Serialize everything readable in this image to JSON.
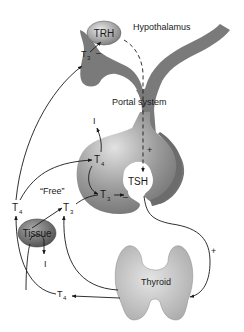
{
  "diagram": {
    "type": "hypothalamic-pituitary-thyroid-axis",
    "labels": {
      "hypothalamus": "Hypothalamus",
      "trh": "TRH",
      "portal_system": "Portal system",
      "tsh": "TSH",
      "thyroid": "Thyroid",
      "tissue": "Tissue",
      "free": "“Free”",
      "t3_hypothalamus": "T",
      "t3_pituitary": "T",
      "t4_pituitary": "T",
      "t4_left": "T",
      "t3_free": "T",
      "t4_bottom": "T",
      "iodide_pituitary": "I",
      "iodide_tissue": "I"
    },
    "subscripts": {
      "t3_hypothalamus": "3",
      "t3_pituitary": "3",
      "t4_pituitary": "4",
      "t4_left": "4",
      "t3_free": "3",
      "t4_bottom": "4"
    },
    "signs": {
      "plus_portal": "+",
      "plus_thyroid": "+",
      "minus_pituitary": "–",
      "minus_hypothalamus": "–"
    },
    "colors": {
      "structure_gray": "#7a7a7a",
      "thyroid_gray": "#c4c4c4",
      "tissue_gray": "#6e6e6e",
      "arrow": "#1a1a1a"
    }
  }
}
